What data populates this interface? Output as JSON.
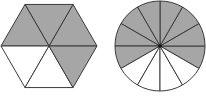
{
  "figures": [
    {
      "name": "hexagon",
      "shape": "regular-hexagon",
      "parts": 6,
      "shaded_parts": 4,
      "shaded_indices": [
        0,
        1,
        2,
        5
      ],
      "fraction": "4/6"
    },
    {
      "name": "circle",
      "shape": "circle",
      "parts": 12,
      "shaded_parts": 8,
      "fraction": "8/12"
    }
  ],
  "colors": {
    "shade": "#a6a6a6",
    "line": "#3a3a3a",
    "background": "#ffffff"
  }
}
